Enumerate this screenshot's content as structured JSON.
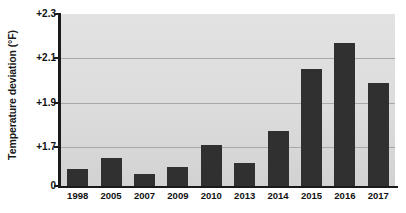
{
  "chart_data": {
    "type": "bar",
    "title": "",
    "xlabel": "",
    "ylabel": "Temperature deviation (°F)",
    "categories": [
      "1998",
      "2005",
      "2007",
      "2009",
      "2010",
      "2013",
      "2014",
      "2015",
      "2016",
      "2017"
    ],
    "values": [
      1.6,
      1.65,
      1.58,
      1.61,
      1.71,
      1.63,
      1.77,
      2.05,
      2.17,
      1.99
    ],
    "ylim": [
      0,
      2.3
    ],
    "baseline": 1.53,
    "ytick_values": [
      0,
      1.7,
      1.9,
      2.1,
      2.3
    ],
    "ytick_labels": [
      "0",
      "+1.7",
      "+1.9",
      "+2.1",
      "+2.3"
    ],
    "gridline_values": [
      1.7,
      1.9,
      2.1
    ],
    "grid": true,
    "legend": "none",
    "bar_color": "#303030",
    "plot_background": "#dcdcdc",
    "axis_color": "#1a1a1a",
    "gridline_color": "#a9a9a9"
  }
}
